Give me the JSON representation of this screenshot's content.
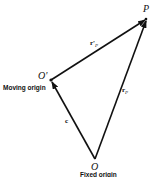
{
  "diagram": {
    "type": "vector-triangle",
    "points": {
      "P": {
        "label": "P",
        "x": 146,
        "y": 19
      },
      "O_prime": {
        "label": "O'",
        "x": 51,
        "y": 80
      },
      "O": {
        "label": "O",
        "x": 95,
        "y": 159
      }
    },
    "vectors": [
      {
        "name": "r_prime_P",
        "from": "O_prime",
        "to": "P",
        "label": "r'",
        "subscript": "P"
      },
      {
        "name": "r_P",
        "from": "O",
        "to": "P",
        "label": "r",
        "subscript": "P"
      },
      {
        "name": "c",
        "from": "O",
        "to": "O_prime",
        "label": "c"
      }
    ],
    "annotations": {
      "moving_origin": "Moving origin",
      "fixed_origin": "Fixed origin"
    },
    "stroke_color": "#111111"
  }
}
